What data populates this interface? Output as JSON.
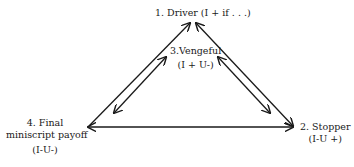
{
  "nodes": {
    "driver": {
      "title": "1.  Driver (I + if . . .)"
    },
    "stopper": {
      "title": "2.  Stopper",
      "sub": "(I-U +)"
    },
    "vengeful": {
      "title": "3.Vengeful",
      "sub": "(I + U-)"
    },
    "final": {
      "line1": "4.  Final",
      "line2": "miniscript payoff",
      "sub": "(I-U-)"
    }
  },
  "colors": {
    "ink": "#1a1a1a",
    "background": "#ffffff"
  }
}
